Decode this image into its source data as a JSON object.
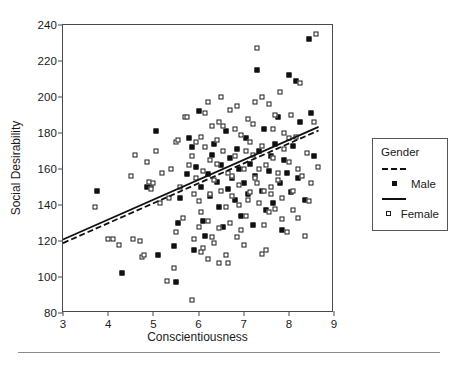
{
  "chart_data": {
    "type": "scatter",
    "title": "",
    "xlabel": "Conscientiousness",
    "ylabel": "Social Desirability",
    "xlim": [
      3,
      9
    ],
    "ylim": [
      80,
      240
    ],
    "xticks": [
      3,
      4,
      5,
      6,
      7,
      8,
      9
    ],
    "yticks": [
      80,
      100,
      120,
      140,
      160,
      180,
      200,
      220,
      240
    ],
    "grid": false,
    "legend": {
      "position": "right",
      "title": "Gender",
      "entries": [
        {
          "label": "Male",
          "marker": "filled-square",
          "line": "dashed",
          "color": "#111111"
        },
        {
          "label": "Female",
          "marker": "open-square",
          "line": "solid",
          "color": "#111111"
        }
      ]
    },
    "series": [
      {
        "name": "Male",
        "marker": "filled-square",
        "fit_line": {
          "style": "dashed",
          "x": [
            3,
            8.7
          ],
          "y": [
            118,
            181
          ]
        },
        "points": [
          [
            3.75,
            148
          ],
          [
            4.3,
            102
          ],
          [
            4.85,
            150
          ],
          [
            4.95,
            151
          ],
          [
            5.05,
            181
          ],
          [
            5.1,
            112
          ],
          [
            5.45,
            117
          ],
          [
            5.5,
            97
          ],
          [
            5.55,
            130
          ],
          [
            5.6,
            144
          ],
          [
            5.75,
            157
          ],
          [
            5.8,
            177
          ],
          [
            5.85,
            172
          ],
          [
            5.9,
            115
          ],
          [
            5.95,
            161
          ],
          [
            6.0,
            192
          ],
          [
            6.05,
            150
          ],
          [
            6.1,
            131
          ],
          [
            6.15,
            123
          ],
          [
            6.2,
            157
          ],
          [
            6.25,
            145
          ],
          [
            6.3,
            168
          ],
          [
            6.35,
            174
          ],
          [
            6.4,
            153
          ],
          [
            6.45,
            139
          ],
          [
            6.5,
            162
          ],
          [
            6.55,
            128
          ],
          [
            6.6,
            181
          ],
          [
            6.65,
            149
          ],
          [
            6.7,
            166
          ],
          [
            6.75,
            155
          ],
          [
            6.8,
            143
          ],
          [
            6.85,
            171
          ],
          [
            6.9,
            160
          ],
          [
            6.95,
            134
          ],
          [
            7.0,
            152
          ],
          [
            7.05,
            177
          ],
          [
            7.1,
            146
          ],
          [
            7.15,
            163
          ],
          [
            7.2,
            129
          ],
          [
            7.25,
            156
          ],
          [
            7.3,
            215
          ],
          [
            7.35,
            170
          ],
          [
            7.4,
            148
          ],
          [
            7.45,
            182
          ],
          [
            7.5,
            137
          ],
          [
            7.55,
            159
          ],
          [
            7.6,
            167
          ],
          [
            7.65,
            141
          ],
          [
            7.7,
            174
          ],
          [
            7.75,
            189
          ],
          [
            7.8,
            152
          ],
          [
            7.85,
            126
          ],
          [
            7.9,
            165
          ],
          [
            7.95,
            158
          ],
          [
            8.0,
            212
          ],
          [
            8.05,
            147
          ],
          [
            8.1,
            173
          ],
          [
            8.15,
            209
          ],
          [
            8.2,
            155
          ],
          [
            8.25,
            186
          ],
          [
            8.35,
            143
          ],
          [
            8.45,
            232
          ],
          [
            8.5,
            191
          ],
          [
            8.55,
            167
          ]
        ]
      },
      {
        "name": "Female",
        "marker": "open-square",
        "fit_line": {
          "style": "solid",
          "x": [
            3,
            8.7
          ],
          "y": [
            120,
            183
          ]
        },
        "points": [
          [
            3.7,
            139
          ],
          [
            4.0,
            121
          ],
          [
            4.1,
            121
          ],
          [
            4.25,
            118
          ],
          [
            4.5,
            156
          ],
          [
            4.55,
            121
          ],
          [
            4.6,
            168
          ],
          [
            4.7,
            120
          ],
          [
            4.75,
            111
          ],
          [
            4.8,
            112
          ],
          [
            4.85,
            164
          ],
          [
            4.9,
            153
          ],
          [
            4.95,
            149
          ],
          [
            5.0,
            152
          ],
          [
            5.05,
            170
          ],
          [
            5.15,
            141
          ],
          [
            5.2,
            158
          ],
          [
            5.3,
            98
          ],
          [
            5.35,
            144
          ],
          [
            5.4,
            160
          ],
          [
            5.45,
            105
          ],
          [
            5.5,
            125
          ],
          [
            5.5,
            175
          ],
          [
            5.55,
            176
          ],
          [
            5.6,
            150
          ],
          [
            5.65,
            133
          ],
          [
            5.7,
            189
          ],
          [
            5.75,
            189
          ],
          [
            5.8,
            162
          ],
          [
            5.85,
            87
          ],
          [
            5.9,
            121
          ],
          [
            5.95,
            155
          ],
          [
            6.0,
            142
          ],
          [
            6.05,
            136
          ],
          [
            6.1,
            116
          ],
          [
            6.15,
            172
          ],
          [
            6.2,
            131
          ],
          [
            6.25,
            146
          ],
          [
            6.3,
            184
          ],
          [
            6.35,
            154
          ],
          [
            6.4,
            163
          ],
          [
            6.45,
            127
          ],
          [
            6.5,
            148
          ],
          [
            6.55,
            170
          ],
          [
            6.6,
            139
          ],
          [
            6.65,
            158
          ],
          [
            6.7,
            193
          ],
          [
            6.75,
            145
          ],
          [
            6.8,
            167
          ],
          [
            6.85,
            122
          ],
          [
            6.9,
            151
          ],
          [
            6.95,
            179
          ],
          [
            7.0,
            160
          ],
          [
            7.05,
            134
          ],
          [
            7.1,
            188
          ],
          [
            7.15,
            147
          ],
          [
            7.2,
            168
          ],
          [
            7.25,
            155
          ],
          [
            7.3,
            227
          ],
          [
            7.35,
            141
          ],
          [
            7.4,
            173
          ],
          [
            7.45,
            129
          ],
          [
            7.5,
            162
          ],
          [
            7.55,
            196
          ],
          [
            7.6,
            150
          ],
          [
            7.65,
            182
          ],
          [
            7.7,
            138
          ],
          [
            7.75,
            158
          ],
          [
            7.8,
            203
          ],
          [
            7.85,
            144
          ],
          [
            7.9,
            171
          ],
          [
            7.95,
            125
          ],
          [
            8.0,
            164
          ],
          [
            8.05,
            190
          ],
          [
            8.1,
            148
          ],
          [
            8.15,
            178
          ],
          [
            8.2,
            133
          ],
          [
            8.25,
            208
          ],
          [
            8.3,
            156
          ],
          [
            8.4,
            169
          ],
          [
            8.45,
            142
          ],
          [
            8.55,
            186
          ],
          [
            8.6,
            235
          ],
          [
            8.65,
            161
          ],
          [
            5.95,
            175
          ],
          [
            6.05,
            178
          ],
          [
            6.2,
            110
          ],
          [
            6.3,
            122
          ],
          [
            6.45,
            186
          ],
          [
            6.6,
            112
          ],
          [
            6.7,
            130
          ],
          [
            6.85,
            195
          ],
          [
            7.0,
            118
          ],
          [
            7.1,
            143
          ],
          [
            7.3,
            152
          ],
          [
            7.4,
            200
          ],
          [
            7.5,
            115
          ],
          [
            7.6,
            146
          ],
          [
            7.7,
            190
          ],
          [
            7.85,
            132
          ],
          [
            8.0,
            177
          ],
          [
            8.2,
            160
          ],
          [
            8.35,
            123
          ],
          [
            8.5,
            152
          ],
          [
            6.1,
            159
          ],
          [
            6.25,
            165
          ],
          [
            6.4,
            176
          ],
          [
            6.55,
            184
          ],
          [
            6.75,
            156
          ],
          [
            6.9,
            140
          ],
          [
            7.05,
            170
          ],
          [
            7.2,
            185
          ],
          [
            7.35,
            160
          ],
          [
            7.45,
            148
          ],
          [
            7.55,
            136
          ],
          [
            7.65,
            166
          ],
          [
            7.75,
            154
          ],
          [
            7.9,
            180
          ],
          [
            8.1,
            137
          ],
          [
            6.0,
            128
          ],
          [
            6.15,
            191
          ],
          [
            6.35,
            119
          ],
          [
            6.5,
            200
          ],
          [
            6.65,
            108
          ],
          [
            6.8,
            182
          ],
          [
            6.95,
            126
          ],
          [
            7.15,
            175
          ],
          [
            7.25,
            197
          ],
          [
            7.4,
            113
          ],
          [
            5.85,
            167
          ],
          [
            5.9,
            146
          ],
          [
            6.05,
            114
          ],
          [
            6.2,
            197
          ],
          [
            6.45,
            108
          ]
        ]
      }
    ]
  },
  "axes": {
    "y_title": "Social Desirability",
    "x_title": "Conscientiousness"
  },
  "legend": {
    "title": "Gender",
    "male_label": "Male",
    "female_label": "Female"
  }
}
